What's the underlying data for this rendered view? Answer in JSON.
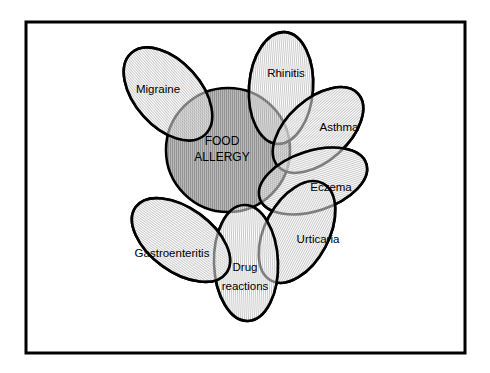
{
  "figure": {
    "name": "food-allergy-venn-diagram",
    "background_color": "#ffffff",
    "border_color": "#000000",
    "stroke_color": "#000000",
    "petal_fill_color": "#e8e8e8",
    "core_fill_color": "#a9a9a9",
    "frame": {
      "x": 26,
      "y": 22,
      "width": 439,
      "height": 331,
      "stroke_width": 3
    }
  },
  "core": {
    "label_line1": "FOOD",
    "label_line2": "ALLERGY",
    "cx": 228,
    "cy": 150,
    "rx": 62,
    "ry": 62
  },
  "petals": [
    {
      "id": "migraine",
      "label": "Migraine",
      "cx": 168,
      "cy": 94,
      "rx": 33,
      "ry": 55,
      "rotate": -42,
      "label_x": 158,
      "label_y": 90
    },
    {
      "id": "rhinitis",
      "label": "Rhinitis",
      "cx": 281,
      "cy": 88,
      "rx": 32,
      "ry": 56,
      "rotate": 4,
      "label_x": 286,
      "label_y": 74
    },
    {
      "id": "asthma",
      "label": "Asthma",
      "cx": 318,
      "cy": 130,
      "rx": 31,
      "ry": 54,
      "rotate": 48,
      "label_x": 339,
      "label_y": 128
    },
    {
      "id": "eczema",
      "label": "Eczema",
      "cx": 313,
      "cy": 181,
      "rx": 30,
      "ry": 56,
      "rotate": 72,
      "label_x": 331,
      "label_y": 188
    },
    {
      "id": "urticaria",
      "label": "Urticaria",
      "cx": 297,
      "cy": 232,
      "rx": 32,
      "ry": 55,
      "rotate": 28,
      "label_x": 318,
      "label_y": 240
    },
    {
      "id": "drug-reactions",
      "label_line1": "Drug",
      "label_line2": "reactions",
      "cx": 246,
      "cy": 263,
      "rx": 32,
      "ry": 58,
      "rotate": -2,
      "label_x": 245,
      "label_y": 268
    },
    {
      "id": "gastroenteritis",
      "label": "Gastroenteritis",
      "cx": 181,
      "cy": 240,
      "rx": 32,
      "ry": 56,
      "rotate": -54,
      "label_x": 172,
      "label_y": 254
    }
  ]
}
